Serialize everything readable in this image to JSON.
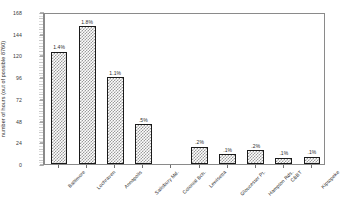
{
  "chart_data": {
    "type": "bar",
    "title": "",
    "xlabel": "",
    "ylabel": "number of hours (out of possible 8760)",
    "ylim": [
      0,
      168
    ],
    "yticks": [
      0,
      24,
      48,
      72,
      96,
      120,
      144,
      168
    ],
    "grid": false,
    "legend": null,
    "categories": [
      "Baltimore",
      "Lochraven",
      "Annapolis",
      "Salisbury Md.",
      "Colonial Bch.",
      "Lewisetta",
      "Gloucester Pt.",
      "Hampton Rds.",
      "CBBT",
      "Kiptopeke"
    ],
    "values": [
      124,
      152,
      96,
      44,
      0,
      19,
      11,
      15,
      7,
      8
    ],
    "data_labels": [
      "1.4%",
      "1.8%",
      "1.1%",
      ".5%",
      "",
      ".2%",
      ".1%",
      ".2%",
      ".1%",
      ".1%"
    ],
    "bar_style": {
      "pattern": "checkerboard",
      "fill": "#9b9b9b",
      "background": "#fefefe",
      "edge": "#1a1a1a"
    },
    "axis_color": "#8a8a8a",
    "text_color": "#2b2b2b"
  }
}
